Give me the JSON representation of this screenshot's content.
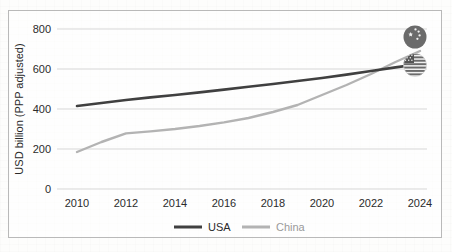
{
  "chart_data": {
    "type": "line",
    "title": "",
    "subtitle": "",
    "xlabel": "",
    "ylabel": "USD billion (PPP adjusted)",
    "xlim": [
      2010,
      2025
    ],
    "ylim": [
      0,
      800
    ],
    "ytick_labels": [
      "0",
      "200",
      "400",
      "600",
      "800"
    ],
    "ytick_values": [
      0,
      200,
      400,
      600,
      800
    ],
    "xtick_labels": [
      "2010",
      "2012",
      "2014",
      "2016",
      "2018",
      "2020",
      "2022",
      "2024"
    ],
    "xtick_values": [
      2010,
      2012,
      2014,
      2016,
      2018,
      2020,
      2022,
      2024
    ],
    "grid": "horizontal",
    "legend_position": "bottom-center",
    "x": [
      2010,
      2011,
      2012,
      2013,
      2014,
      2015,
      2016,
      2017,
      2018,
      2019,
      2020,
      2021,
      2022,
      2023,
      2024
    ],
    "series": [
      {
        "name": "USA",
        "color": "#404040",
        "values": [
          415,
          430,
          445,
          458,
          470,
          483,
          497,
          511,
          525,
          540,
          555,
          572,
          590,
          608,
          625
        ]
      },
      {
        "name": "China",
        "color": "#b3b3b3",
        "values": [
          185,
          235,
          278,
          288,
          300,
          315,
          333,
          355,
          385,
          420,
          470,
          520,
          575,
          635,
          690
        ]
      }
    ],
    "annotations": [
      {
        "name": "china-flag-badge",
        "label": "China flag",
        "x": 2024.3,
        "y": 760
      },
      {
        "name": "usa-flag-badge",
        "label": "USA flag",
        "x": 2024.3,
        "y": 625
      }
    ]
  },
  "legend": {
    "items": [
      {
        "label": "USA",
        "color": "#404040"
      },
      {
        "label": "China",
        "color": "#b3b3b3"
      }
    ]
  },
  "flags": {
    "china": {
      "name": "china-flag-icon",
      "field_color": "#6b6b6b",
      "star_color": "#f2f2f2",
      "stars": 5
    },
    "usa": {
      "name": "usa-flag-icon",
      "stripe_dark": "#6b6b6b",
      "stripe_light": "#f0f0f0",
      "canton_color": "#555555",
      "stripes": 7
    }
  }
}
